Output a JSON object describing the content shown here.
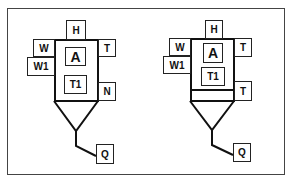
{
  "diagrams": [
    {
      "name": "left",
      "labels": {
        "top": "H",
        "upper_left": "W",
        "lower_left": "W1",
        "upper_right": "T",
        "center_top": "A",
        "center_bottom": "T1",
        "lower_right": "N",
        "outlet": "Q"
      }
    },
    {
      "name": "right",
      "labels": {
        "top": "H",
        "upper_left": "W",
        "lower_left": "W1",
        "upper_right": "T",
        "center_top": "A",
        "center_bottom": "T1",
        "lower_right": "T",
        "outlet": "Q"
      }
    }
  ]
}
